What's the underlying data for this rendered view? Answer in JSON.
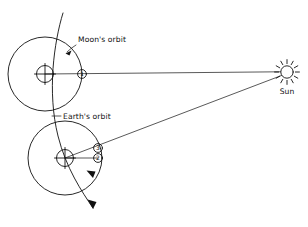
{
  "figure": {
    "background_color": "#ffffff",
    "stroke_color": "#111111",
    "width": 308,
    "height": 227
  },
  "labels": {
    "moons_orbit": "Moon's orbit",
    "earths_orbit": "Earth's orbit",
    "sun": "Sun"
  },
  "bodies": {
    "sun": {
      "name": "Sun",
      "symbol": "sun-rays",
      "cx": 287,
      "cy": 72,
      "r": 6.2,
      "ray_count": 12,
      "ray_inner": 7.5,
      "ray_outer": 11
    },
    "earth_upper": {
      "name": "Earth",
      "symbol": "crossed-circle",
      "cx": 45,
      "cy": 74,
      "r": 8.5
    },
    "earth_lower": {
      "name": "Earth",
      "symbol": "crossed-circle",
      "cx": 65,
      "cy": 158,
      "r": 8.5
    },
    "moon_1": {
      "name": "Moon position 1",
      "label": "1",
      "cx": 82,
      "cy": 74,
      "r": 4.2
    },
    "moon_3": {
      "name": "Moon position 3",
      "label": "3",
      "cx": 98,
      "cy": 148,
      "r": 4.2
    },
    "moon_2": {
      "name": "Moon position 2",
      "label": "2",
      "cx": 98,
      "cy": 158,
      "r": 4.2
    }
  },
  "orbits": {
    "moon_orbit_upper": {
      "cx": 45,
      "cy": 74,
      "r": 37
    },
    "moon_orbit_lower": {
      "cx": 65,
      "cy": 158,
      "r": 37
    },
    "earth_orbit_path": "M 63 13 C 52 48, 47 98, 62 148 C 74 182, 86 196, 95 209",
    "earth_orbit_direction_arrow": "at lower end of curve, pointing down-right",
    "moon_orbit_direction_arrow": "on lower moon-orbit circle, pointing clockwise"
  },
  "sight_lines": {
    "moon1_to_sun": {
      "x1": 82,
      "y1": 74,
      "x2": 281,
      "y2": 72
    },
    "moon3_to_sun": {
      "x1": 98,
      "y1": 148,
      "x2": 282,
      "y2": 75
    },
    "earth_lower_to_moon3": {
      "x1": 65,
      "y1": 158,
      "x2": 98,
      "y2": 148
    },
    "earth_lower_to_moon2": {
      "x1": 65,
      "y1": 158,
      "x2": 98,
      "y2": 158
    },
    "earth_upper_to_moon1": {
      "x1": 45,
      "y1": 74,
      "x2": 82,
      "y2": 74
    }
  },
  "leaders": {
    "moons_orbit_leader": {
      "text_x": 76,
      "text_y": 43,
      "line": "M 74 45 L 66 53",
      "arrow_at": [
        66,
        53
      ]
    },
    "earths_orbit_leader": {
      "text_x": 62,
      "text_y": 119,
      "line": "M 60 116 L 52 116"
    }
  }
}
